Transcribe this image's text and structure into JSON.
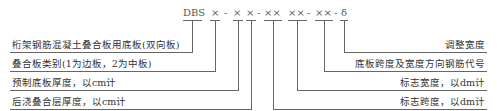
{
  "code": {
    "prefix": "DBS",
    "parts": [
      "×",
      "-",
      "×",
      "×",
      "-",
      "××",
      "××",
      "-",
      "××",
      "-",
      "δ"
    ]
  },
  "left_labels": [
    "桁架钢筋混凝土叠合板用底板(双向板)",
    "叠合板类别(1为边板，2为中板)",
    "预制底板厚度，以cm计",
    "后浇叠合层厚度，以cm计"
  ],
  "right_labels": [
    "调整宽度",
    "底板跨度及宽度方向钢筋代号",
    "标志宽度，以dm计",
    "标志跨度，以dm计"
  ]
}
